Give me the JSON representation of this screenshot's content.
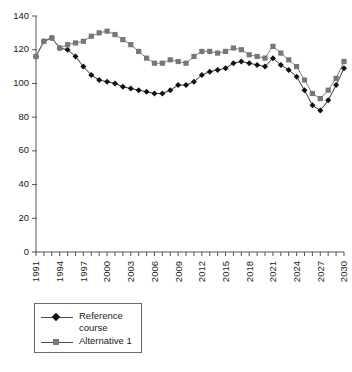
{
  "chart_data": {
    "type": "line",
    "title": "",
    "subtitle": "",
    "xlabel": "",
    "ylabel": "",
    "ylim": [
      0,
      140
    ],
    "yticks": [
      0,
      20,
      40,
      60,
      80,
      100,
      120,
      140
    ],
    "xlim": [
      1991,
      2030
    ],
    "grid": false,
    "legend_position": "below-left",
    "x": [
      1991,
      1992,
      1993,
      1994,
      1995,
      1996,
      1997,
      1998,
      1999,
      2000,
      2001,
      2002,
      2003,
      2004,
      2005,
      2006,
      2007,
      2008,
      2009,
      2010,
      2011,
      2012,
      2013,
      2014,
      2015,
      2016,
      2017,
      2018,
      2019,
      2020,
      2021,
      2022,
      2023,
      2024,
      2025,
      2026,
      2027,
      2028,
      2029,
      2030
    ],
    "xtick_labels": [
      "1991",
      "1994",
      "1997",
      "2000",
      "2003",
      "2006",
      "2009",
      "2012",
      "2015",
      "2018",
      "2021",
      "2024",
      "2027",
      "2030"
    ],
    "xtick_values": [
      1991,
      1994,
      1997,
      2000,
      2003,
      2006,
      2009,
      2012,
      2015,
      2018,
      2021,
      2024,
      2027,
      2030
    ],
    "series": [
      {
        "name": "Reference course",
        "marker": "diamond",
        "color": "#111111",
        "values": [
          116,
          125,
          127,
          121,
          120,
          116,
          110,
          105,
          102,
          101,
          100,
          98,
          97,
          96,
          95,
          94,
          94,
          96,
          99,
          99,
          101,
          105,
          107,
          108,
          109,
          112,
          113,
          112,
          111,
          110,
          115,
          111,
          108,
          104,
          96,
          87,
          84,
          90,
          99,
          109
        ]
      },
      {
        "name": "Alternative 1",
        "marker": "square",
        "color": "#777777",
        "values": [
          116,
          125,
          127,
          121,
          123,
          124,
          125,
          128,
          130,
          131,
          129,
          126,
          123,
          119,
          115,
          112,
          112,
          114,
          113,
          112,
          116,
          119,
          119,
          118,
          119,
          121,
          120,
          117,
          116,
          115,
          122,
          118,
          114,
          110,
          102,
          94,
          91,
          96,
          103,
          113
        ]
      }
    ]
  },
  "legend": {
    "entries": [
      {
        "label": "Reference\ncourse"
      },
      {
        "label": "Alternative 1"
      }
    ]
  }
}
